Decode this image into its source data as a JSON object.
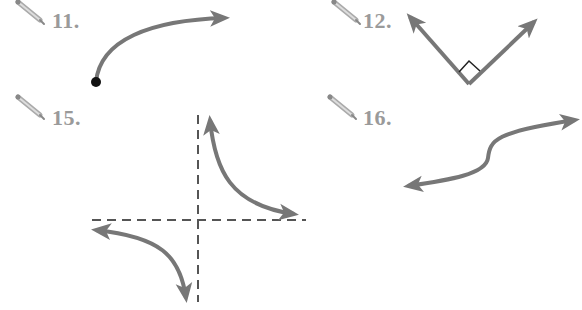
{
  "colors": {
    "curve": "#777777",
    "label": "#9a9a9a",
    "dashed": "#555555",
    "point": "#111111",
    "background": "#ffffff"
  },
  "exercises": [
    {
      "number": "11.",
      "icon": "pencil-icon",
      "figure": "curve-from-point-with-arrow"
    },
    {
      "number": "12.",
      "icon": "pencil-icon",
      "figure": "right-angle-two-rays"
    },
    {
      "number": "15.",
      "icon": "pencil-icon",
      "figure": "hyperbola-with-dashed-asymptotes"
    },
    {
      "number": "16.",
      "icon": "pencil-icon",
      "figure": "s-curve-double-arrow"
    }
  ]
}
